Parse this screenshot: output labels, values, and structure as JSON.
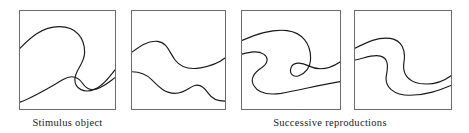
{
  "figure": {
    "background_color": "#ffffff",
    "line_color": "#1a1a1a",
    "border_color": "#6b6b6b",
    "width": 469,
    "height": 133
  },
  "captions": {
    "stimulus": "Stimulus object",
    "reproductions": "Successive reproductions"
  },
  "panels": [
    {
      "id": "panel-1",
      "role": "stimulus-object",
      "index": 1,
      "box": {
        "x": 19,
        "y": 10,
        "width": 97,
        "height": 100
      },
      "curves": [
        {
          "name": "upper-curve",
          "path": "M 0 38 C 10 28, 22 16, 40 16 C 58 16, 66 28, 66 42 C 66 54, 56 60, 56 70 C 56 80, 66 84, 76 80 C 86 76, 92 66, 97 60"
        },
        {
          "name": "lower-curve",
          "path": "M 0 93 C 14 88, 30 78, 44 70 C 54 64, 60 68, 64 74 C 68 80, 74 82, 82 78 C 90 74, 94 70, 97 68"
        }
      ]
    },
    {
      "id": "panel-2",
      "role": "reproduction",
      "index": 2,
      "box": {
        "x": 131,
        "y": 10,
        "width": 95,
        "height": 100
      },
      "curves": [
        {
          "name": "upper-curve",
          "path": "M 0 42 C 8 36, 16 30, 26 31 C 36 32, 38 42, 44 50 C 50 58, 58 60, 70 58 C 82 56, 90 52, 95 48"
        },
        {
          "name": "lower-curve",
          "path": "M 0 62 C 8 62, 14 64, 20 70 C 28 78, 34 84, 44 84 C 54 84, 58 78, 64 76 C 70 74, 74 78, 78 84 C 82 90, 88 92, 95 92"
        }
      ]
    },
    {
      "id": "panel-3",
      "role": "reproduction",
      "index": 3,
      "box": {
        "x": 241,
        "y": 10,
        "width": 100,
        "height": 100
      },
      "curves": [
        {
          "name": "upper-hook-curve",
          "path": "M 0 30 C 14 24, 30 18, 46 20 C 62 22, 70 34, 70 48 C 70 58, 64 64, 58 66 C 52 68, 48 64, 50 58 C 52 52, 60 52, 68 56 C 78 61, 88 60, 100 52"
        },
        {
          "name": "lower-hook-curve",
          "path": "M 0 44 C 8 42, 16 40, 22 44 C 28 48, 26 54, 20 58 C 12 63, 8 70, 12 76 C 16 83, 26 86, 40 84 C 58 81, 76 76, 100 72"
        }
      ]
    },
    {
      "id": "panel-4",
      "role": "reproduction",
      "index": 4,
      "box": {
        "x": 354,
        "y": 10,
        "width": 98,
        "height": 100
      },
      "curves": [
        {
          "name": "upper-s-curve",
          "path": "M 0 38 C 12 32, 24 26, 36 28 C 48 30, 52 40, 50 52 C 48 64, 54 72, 66 74 C 80 76, 90 72, 98 66"
        },
        {
          "name": "lower-s-curve",
          "path": "M 0 50 C 10 48, 18 44, 26 46 C 34 48, 34 56, 32 66 C 30 78, 40 86, 56 86 C 74 86, 88 80, 98 76"
        }
      ]
    }
  ]
}
